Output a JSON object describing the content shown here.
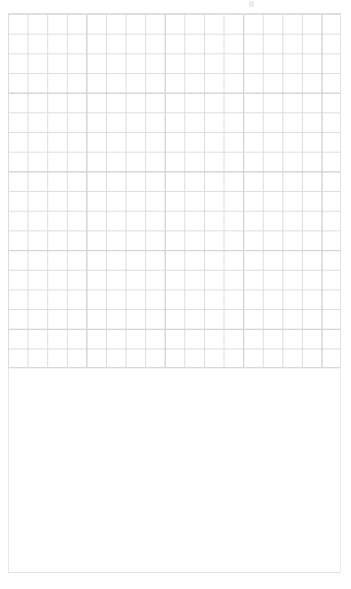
{
  "page": {
    "width": 351,
    "height": 589,
    "background_color": "#ffffff"
  },
  "grid_canvas": {
    "name": "graph-paper-grid",
    "x": 8,
    "y": 14,
    "width": 333,
    "height": 354,
    "columns": 17,
    "rows": 18,
    "cell_width": 19.6,
    "cell_height": 19.68,
    "minor_line_color": "#dddddd",
    "major_line_color": "#d2d2d2",
    "major_line_every": 4,
    "background_color": "#ffffff",
    "border_color": "#e2e2e2",
    "content": ""
  },
  "content_panel": {
    "name": "empty-content-panel",
    "x": 8,
    "y": 368,
    "width": 333,
    "height": 205,
    "background_color": "#ffffff",
    "border_color": "#e6e6e6",
    "content": ""
  },
  "artifacts": {
    "top_mark_color": "#e9e9ee",
    "top_hairline_color": "#dedede"
  }
}
